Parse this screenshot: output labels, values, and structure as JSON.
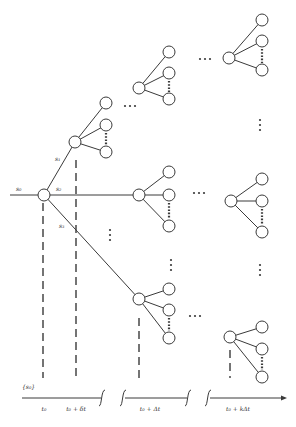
{
  "diagram": {
    "stroke_color": "#3a3a3a",
    "node_fill": "#ffffff",
    "node_radius": 6,
    "root": {
      "x": 44,
      "y": 195,
      "label": "s0"
    },
    "incoming_label": {
      "text": "s₀",
      "x": 16,
      "y": 191
    },
    "branch_labels": [
      {
        "text": "s₁",
        "x": 55,
        "y": 161
      },
      {
        "text": "s₂",
        "x": 56,
        "y": 191
      },
      {
        "text": "s₃",
        "x": 59,
        "y": 228
      }
    ],
    "level1_nodes": [
      {
        "id": "n1",
        "x": 75,
        "y": 142
      }
    ],
    "parents": [
      {
        "id": "p_s1",
        "x": 75,
        "y": 142,
        "children": [
          {
            "x": 106,
            "y": 103
          },
          {
            "x": 106,
            "y": 125
          },
          {
            "x": 106,
            "y": 152
          }
        ]
      },
      {
        "id": "p_up_mid",
        "x": 139,
        "y": 88,
        "children": [
          {
            "x": 169,
            "y": 52
          },
          {
            "x": 169,
            "y": 73
          },
          {
            "x": 169,
            "y": 99
          }
        ]
      },
      {
        "id": "p_top_right",
        "x": 229,
        "y": 58,
        "children": [
          {
            "x": 262,
            "y": 20
          },
          {
            "x": 262,
            "y": 41
          },
          {
            "x": 262,
            "y": 70
          }
        ]
      },
      {
        "id": "p_mid",
        "x": 139,
        "y": 195,
        "children": [
          {
            "x": 169,
            "y": 172
          },
          {
            "x": 169,
            "y": 195
          },
          {
            "x": 169,
            "y": 226
          }
        ]
      },
      {
        "id": "p_mid_right",
        "x": 231,
        "y": 201,
        "children": [
          {
            "x": 262,
            "y": 179
          },
          {
            "x": 262,
            "y": 201
          },
          {
            "x": 262,
            "y": 232
          }
        ]
      },
      {
        "id": "p_low_mid",
        "x": 139,
        "y": 299,
        "children": [
          {
            "x": 169,
            "y": 289
          },
          {
            "x": 169,
            "y": 310
          },
          {
            "x": 169,
            "y": 338
          }
        ]
      },
      {
        "id": "p_low_right",
        "x": 230,
        "y": 337,
        "children": [
          {
            "x": 262,
            "y": 327
          },
          {
            "x": 262,
            "y": 349
          },
          {
            "x": 262,
            "y": 377
          }
        ]
      }
    ],
    "ellipsis_h": [
      {
        "x": 130,
        "y": 106
      },
      {
        "x": 205,
        "y": 59
      },
      {
        "x": 199,
        "y": 193
      },
      {
        "x": 195,
        "y": 316
      }
    ],
    "ellipsis_v": [
      {
        "x": 110,
        "y": 235
      },
      {
        "x": 171,
        "y": 265
      },
      {
        "x": 260,
        "y": 125
      },
      {
        "x": 260,
        "y": 270
      }
    ],
    "dashed_verticals": [
      {
        "x": 43,
        "y1": 203,
        "y2": 378
      },
      {
        "x": 76,
        "y1": 160,
        "y2": 378
      },
      {
        "x": 139,
        "y1": 318,
        "y2": 378
      },
      {
        "x": 230,
        "y1": 350,
        "y2": 378
      }
    ],
    "state_set_label": {
      "text": "{s₀}",
      "x": 22,
      "y": 389
    },
    "time_axis": {
      "y": 398,
      "segments": [
        {
          "x1": 22,
          "x2": 101
        },
        {
          "x1": 125,
          "x2": 187
        },
        {
          "x1": 210,
          "x2": 283
        }
      ],
      "breaks": [
        {
          "x": 102
        },
        {
          "x": 123
        },
        {
          "x": 188
        },
        {
          "x": 208
        }
      ],
      "ticks": [
        {
          "label": "t₀",
          "x": 44
        },
        {
          "label": "t₀ + δt",
          "x": 76
        },
        {
          "label": "t₀ + Δt",
          "x": 150
        },
        {
          "label": "t₀ + kΔt",
          "x": 238
        }
      ]
    }
  }
}
